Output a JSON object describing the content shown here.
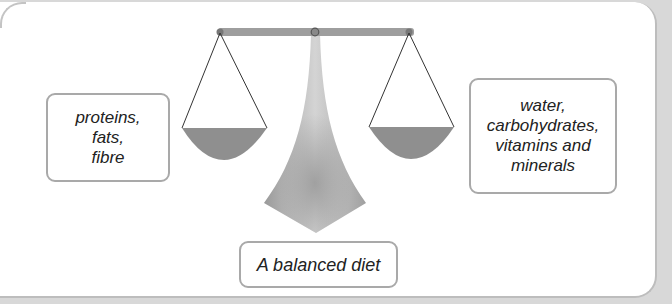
{
  "diagram": {
    "type": "balance-scale",
    "left_pan": {
      "lines": [
        "proteins,",
        "fats,",
        "fibre"
      ]
    },
    "right_pan": {
      "lines": [
        "water,",
        "carbohydrates,",
        "vitamins and",
        "minerals"
      ]
    },
    "caption": "A balanced diet"
  },
  "colors": {
    "background": "#d8d8d8",
    "panel": "#ffffff",
    "panel_border": "#bdbdbd",
    "box_border": "#a9a9a9",
    "beam": "#9e9e9e",
    "pan_fill": "#8f8f8f",
    "stand": "#b0b0b0",
    "text": "#222222"
  }
}
